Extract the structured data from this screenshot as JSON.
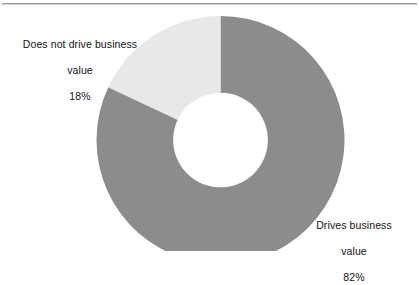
{
  "figure": {
    "background_color": "#ffffff",
    "rule_color": "#9a9a9a"
  },
  "chart_data": {
    "type": "pie",
    "variant": "donut",
    "title": "",
    "subtitle": "",
    "xlabel": "",
    "ylabel": "",
    "legend_position": "none",
    "grid": false,
    "start_angle_deg": 0,
    "direction": "clockwise",
    "inner_radius_ratio": 0.382,
    "categories": [
      "Drives business value",
      "Does not drive business value"
    ],
    "values": [
      82,
      18
    ],
    "value_unit": "%",
    "colors": [
      "#8c8c8c",
      "#e8e8e8"
    ],
    "data_labels": [
      "82%",
      "18%"
    ],
    "annotations": [
      {
        "name": "does-not-drive-business-value",
        "lines": [
          "Does not drive business",
          "value",
          "18%"
        ],
        "value": 18,
        "color": "#e8e8e8",
        "position": "top-left"
      },
      {
        "name": "drives-business-value",
        "lines": [
          "Drives business",
          "value",
          "82%"
        ],
        "value": 82,
        "color": "#8c8c8c",
        "position": "bottom-right"
      }
    ]
  },
  "labels": {
    "left": {
      "line1": "Does not drive business",
      "line2": "value",
      "line3": "18%"
    },
    "right": {
      "line1": "Drives business",
      "line2": "value",
      "line3": "82%"
    }
  }
}
